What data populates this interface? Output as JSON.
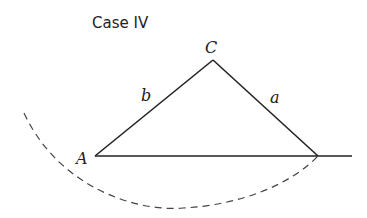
{
  "title": "Case IV",
  "labels": {
    "vertex_c": "C",
    "vertex_a": "A",
    "side_b": "b",
    "side_a": "a"
  },
  "colors": {
    "line": "#222222",
    "background": "#ffffff"
  }
}
